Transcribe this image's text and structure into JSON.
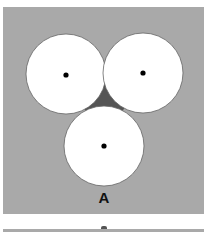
{
  "figure": {
    "label": "A",
    "colors": {
      "panel_background": "#a9a9a9",
      "interstitial_gap": "#555555",
      "circle_fill": "#ffffff",
      "circle_stroke": "#666666",
      "center_dot": "#000000"
    },
    "circles": [
      {
        "name": "top-left",
        "cx": 66,
        "cy": 74,
        "r": 40
      },
      {
        "name": "top-right",
        "cx": 143,
        "cy": 73,
        "r": 40
      },
      {
        "name": "bottom",
        "cx": 104,
        "cy": 146,
        "r": 40
      }
    ]
  }
}
